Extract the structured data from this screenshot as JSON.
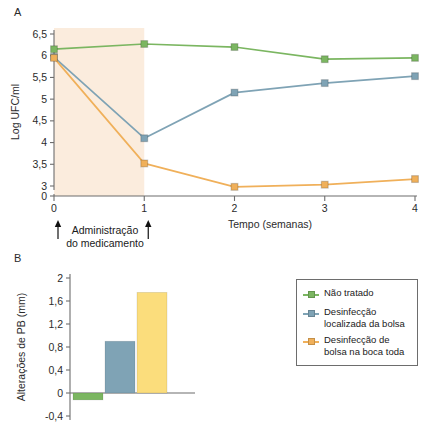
{
  "figure": {
    "panel_a_letter": "A",
    "panel_b_letter": "B"
  },
  "legend": {
    "items": [
      {
        "label": "Não tratado",
        "color": "#7bb661"
      },
      {
        "label": "Desinfecção localizada da bolsa",
        "color": "#7fa3b5"
      },
      {
        "label": "Desinfecção de bolsa na boca toda",
        "color": "#f0b05a"
      }
    ]
  },
  "annotations": {
    "treatment_note_line1": "Administração",
    "treatment_note_line2": "do medicamento"
  },
  "chart_data": [
    {
      "panel": "A",
      "type": "line",
      "title": "",
      "xlabel": "Tempo (semanas)",
      "ylabel": "Log UFC/ml",
      "x": [
        0,
        1,
        2,
        3,
        4
      ],
      "xticklabels": [
        "0",
        "1",
        "2",
        "3",
        "4"
      ],
      "xlim": [
        0,
        4
      ],
      "yticklabels": [
        "0",
        "3",
        "3,5",
        "4",
        "4,5",
        "5",
        "5,5",
        "6",
        "6,5"
      ],
      "ytickvalues": [
        0,
        3,
        3.5,
        4,
        4.5,
        5,
        5.5,
        6,
        6.5
      ],
      "ylim": [
        3,
        6.5
      ],
      "axis_break": true,
      "axis_break_note": "Y axis broken between 0 and 3",
      "grid": false,
      "shaded_region": {
        "x_start": 0,
        "x_end": 1,
        "color": "#fae5d0"
      },
      "series": [
        {
          "name": "Não tratado",
          "color": "#7bb661",
          "values": [
            6.15,
            6.27,
            6.2,
            5.92,
            5.95
          ]
        },
        {
          "name": "Desinfecção localizada da bolsa",
          "color": "#7fa3b5",
          "values": [
            5.97,
            4.1,
            5.15,
            5.37,
            5.53
          ]
        },
        {
          "name": "Desinfecção de bolsa na boca toda",
          "color": "#f0b05a",
          "values": [
            5.95,
            3.52,
            2.98,
            3.03,
            3.16
          ]
        }
      ]
    },
    {
      "panel": "B",
      "type": "bar",
      "title": "",
      "xlabel": "",
      "ylabel": "Alterações de PB (mm)",
      "categories": [
        "Não tratado",
        "Desinfecção localizada da bolsa",
        "Desinfecção de bolsa na boca toda"
      ],
      "values": [
        -0.12,
        0.9,
        1.75
      ],
      "colors": [
        "#7bb661",
        "#7fa3b5",
        "#fbdd7c"
      ],
      "yticklabels": [
        "-0,4",
        "0",
        "0,4",
        "0,8",
        "1,2",
        "1,6",
        "2"
      ],
      "ytickvalues": [
        -0.4,
        0,
        0.4,
        0.8,
        1.2,
        1.6,
        2
      ],
      "ylim": [
        -0.4,
        2
      ],
      "grid": false,
      "legend_position": "right"
    }
  ]
}
